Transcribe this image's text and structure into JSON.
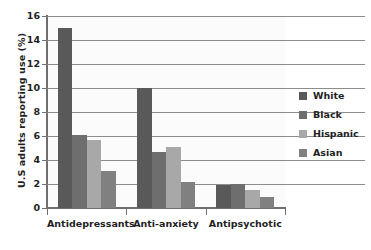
{
  "chart_data": {
    "type": "bar",
    "title": "",
    "xlabel": "",
    "ylabel": "U.S adults reporting use (%)",
    "ylim": [
      0,
      16
    ],
    "yticks": [
      0,
      2,
      4,
      6,
      8,
      10,
      12,
      14,
      16
    ],
    "ytick_labels": [
      "0",
      "2",
      "4",
      "6",
      "8",
      "10",
      "12",
      "14",
      "16"
    ],
    "grid": true,
    "legend_position": "right",
    "categories": [
      "Antidepressants",
      "Anti-anxiety",
      "Antipsychotic"
    ],
    "series": [
      {
        "name": "White",
        "color": "#595959",
        "values": [
          15.0,
          10.0,
          1.9
        ]
      },
      {
        "name": "Black",
        "color": "#6e6e6e",
        "values": [
          6.1,
          4.7,
          2.0
        ]
      },
      {
        "name": "Hispanic",
        "color": "#a8a8a8",
        "values": [
          5.7,
          5.1,
          1.5
        ]
      },
      {
        "name": "Asian",
        "color": "#808080",
        "values": [
          3.1,
          2.2,
          0.9
        ]
      }
    ]
  },
  "figure": {
    "background_color": "#ffffff",
    "plot_background_color": "#fbfbfb",
    "axis_color": "#6f6f6f",
    "gridline_color": "#8d8d8d",
    "text_color": "#1f1f1f"
  }
}
